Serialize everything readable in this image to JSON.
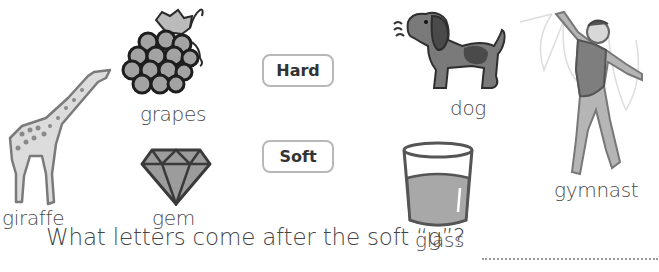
{
  "pictures": [
    {
      "id": "giraffe",
      "label": "giraffe",
      "icon": "giraffe-icon"
    },
    {
      "id": "grapes",
      "label": "grapes",
      "icon": "grapes-icon"
    },
    {
      "id": "gem",
      "label": "gem",
      "icon": "gem-icon"
    },
    {
      "id": "dog",
      "label": "dog",
      "icon": "dog-icon"
    },
    {
      "id": "glass",
      "label": "glass",
      "icon": "glass-icon"
    },
    {
      "id": "gymnast",
      "label": "gymnast",
      "icon": "gymnast-icon"
    }
  ],
  "categories": {
    "hard": "Hard",
    "soft": "Soft"
  },
  "question": {
    "text": "What letters come after the soft “g”?",
    "answer": ""
  },
  "colors": {
    "pill_border": "#b8b8b8",
    "text": "#444444",
    "illustration_fill": "#9a9a9a",
    "illustration_stroke": "#3a3a3a"
  }
}
